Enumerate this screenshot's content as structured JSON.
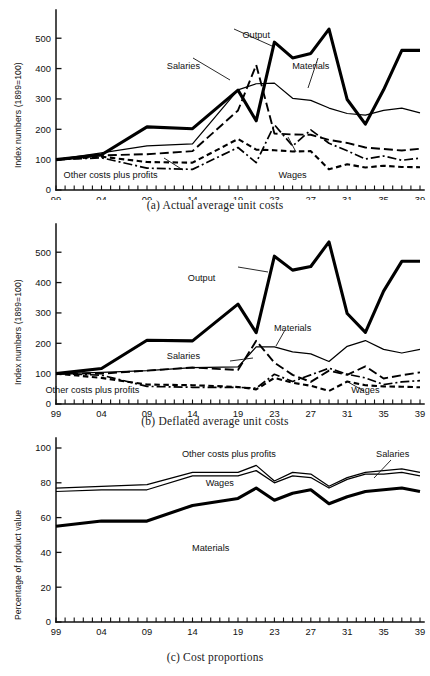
{
  "figure": {
    "panels": [
      {
        "id": "a",
        "caption": "(a)  Actual average unit costs",
        "ylabel": "Index numbers (1899=100)"
      },
      {
        "id": "b",
        "caption": "(b)  Deflated average unit costs",
        "ylabel": "Index numbers (1899=100)"
      },
      {
        "id": "c",
        "caption": "(c)  Cost proportions",
        "ylabel": "Percentage of product value"
      }
    ]
  },
  "chart_data": [
    {
      "type": "line",
      "panel": "a",
      "title": "(a)  Actual average unit costs",
      "xlabel": "",
      "ylabel": "Index numbers (1899=100)",
      "ylim": [
        0,
        560
      ],
      "yticks": [
        0,
        100,
        200,
        300,
        400,
        500
      ],
      "ytick_labels": [
        "0",
        "100",
        "200",
        "300",
        "400",
        "500"
      ],
      "xlim": [
        1899,
        1939
      ],
      "xticks": [
        1899,
        1904,
        1909,
        1914,
        1919,
        1921,
        1923,
        1925,
        1927,
        1929,
        1931,
        1933,
        1935,
        1937,
        1939
      ],
      "xtick_labels": [
        "99",
        "04",
        "09",
        "14",
        "19",
        "",
        "23",
        "",
        "27",
        "",
        "31",
        "",
        "35",
        "",
        "39"
      ],
      "grid": false,
      "legend_position": "inline-annotations",
      "x": [
        1899,
        1904,
        1909,
        1914,
        1919,
        1921,
        1923,
        1925,
        1927,
        1929,
        1931,
        1933,
        1935,
        1937,
        1939
      ],
      "series": [
        {
          "name": "Output",
          "style": "thick-solid",
          "values": [
            100,
            116,
            208,
            202,
            329,
            228,
            487,
            435,
            450,
            530,
            298,
            217,
            330,
            460,
            460
          ]
        },
        {
          "name": "Materials",
          "style": "thin-solid",
          "values": [
            100,
            122,
            145,
            152,
            330,
            350,
            352,
            302,
            295,
            270,
            252,
            247,
            262,
            270,
            254
          ]
        },
        {
          "name": "Salaries",
          "style": "long-dash",
          "values": [
            100,
            114,
            118,
            128,
            262,
            412,
            186,
            183,
            182,
            165,
            155,
            140,
            135,
            130,
            136
          ]
        },
        {
          "name": "Wages",
          "style": "short-dash",
          "values": [
            100,
            110,
            92,
            90,
            168,
            133,
            131,
            127,
            128,
            68,
            85,
            74,
            80,
            76,
            75
          ]
        },
        {
          "name": "Other costs plus profits",
          "style": "dash-dot",
          "values": [
            100,
            106,
            72,
            68,
            140,
            90,
            215,
            145,
            198,
            154,
            129,
            102,
            112,
            98,
            105
          ]
        }
      ],
      "annotations": [
        {
          "text": "Output",
          "x": 1921,
          "y": 500
        },
        {
          "text": "Salaries",
          "x": 1913,
          "y": 400
        },
        {
          "text": "Materials",
          "x": 1927,
          "y": 400
        },
        {
          "text": "Wages",
          "x": 1925,
          "y": 38
        },
        {
          "text": "Other costs plus profits",
          "x": 1905,
          "y": 38
        }
      ]
    },
    {
      "type": "line",
      "panel": "b",
      "title": "(b)  Deflated average unit costs",
      "xlabel": "",
      "ylabel": "Index numbers (1899=100)",
      "ylim": [
        0,
        560
      ],
      "yticks": [
        0,
        100,
        200,
        300,
        400,
        500
      ],
      "ytick_labels": [
        "0",
        "100",
        "200",
        "300",
        "400",
        "500"
      ],
      "xlim": [
        1899,
        1939
      ],
      "xticks": [
        1899,
        1904,
        1909,
        1914,
        1919,
        1921,
        1923,
        1925,
        1927,
        1929,
        1931,
        1933,
        1935,
        1937,
        1939
      ],
      "xtick_labels": [
        "99",
        "04",
        "09",
        "14",
        "19",
        "",
        "23",
        "",
        "27",
        "",
        "31",
        "",
        "35",
        "",
        "39"
      ],
      "grid": false,
      "legend_position": "inline-annotations",
      "x": [
        1899,
        1904,
        1909,
        1914,
        1919,
        1921,
        1923,
        1925,
        1927,
        1929,
        1931,
        1933,
        1935,
        1937,
        1939
      ],
      "series": [
        {
          "name": "Output",
          "style": "thick-solid",
          "values": [
            100,
            117,
            210,
            208,
            329,
            235,
            487,
            441,
            453,
            534,
            298,
            236,
            372,
            470,
            470
          ]
        },
        {
          "name": "Materials",
          "style": "thin-solid",
          "values": [
            100,
            104,
            110,
            120,
            122,
            188,
            188,
            172,
            165,
            140,
            190,
            209,
            180,
            168,
            180
          ]
        },
        {
          "name": "Salaries",
          "style": "long-dash",
          "values": [
            100,
            100,
            110,
            120,
            112,
            208,
            136,
            96,
            73,
            110,
            96,
            124,
            84,
            95,
            104
          ]
        },
        {
          "name": "Wages",
          "style": "short-dash",
          "values": [
            100,
            86,
            64,
            62,
            56,
            48,
            86,
            70,
            60,
            43,
            74,
            62,
            58,
            57,
            55
          ]
        },
        {
          "name": "Other costs plus profits",
          "style": "dash-dot",
          "values": [
            100,
            95,
            58,
            55,
            55,
            52,
            98,
            74,
            96,
            118,
            98,
            86,
            64,
            73,
            77
          ]
        }
      ],
      "annotations": [
        {
          "text": "Output",
          "x": 1915,
          "y": 405
        },
        {
          "text": "Materials",
          "x": 1925,
          "y": 240
        },
        {
          "text": "Salaries",
          "x": 1913,
          "y": 148
        },
        {
          "text": "Wages",
          "x": 1933,
          "y": 36
        },
        {
          "text": "Other costs plus profits",
          "x": 1903,
          "y": 36
        }
      ]
    },
    {
      "type": "line",
      "panel": "c",
      "title": "(c)  Cost proportions",
      "xlabel": "",
      "ylabel": "Percentage of product value",
      "ylim": [
        0,
        100
      ],
      "yticks": [
        0,
        20,
        40,
        60,
        80,
        100
      ],
      "ytick_labels": [
        "0",
        "20",
        "40",
        "60",
        "80",
        "100"
      ],
      "xlim": [
        1899,
        1939
      ],
      "xticks": [
        1899,
        1904,
        1909,
        1914,
        1919,
        1921,
        1923,
        1925,
        1927,
        1929,
        1931,
        1933,
        1935,
        1937,
        1939
      ],
      "xtick_labels": [
        "99",
        "04",
        "09",
        "14",
        "19",
        "",
        "23",
        "",
        "27",
        "",
        "31",
        "",
        "35",
        "",
        "39"
      ],
      "grid": false,
      "legend_position": "inline-annotations",
      "x": [
        1899,
        1904,
        1909,
        1914,
        1919,
        1921,
        1923,
        1925,
        1927,
        1929,
        1931,
        1933,
        1935,
        1937,
        1939
      ],
      "series": [
        {
          "name": "Other costs plus profits",
          "style": "thin-solid",
          "values": [
            77,
            78,
            79,
            86,
            86,
            90,
            81,
            86,
            85,
            78,
            83,
            86,
            87,
            88,
            86
          ]
        },
        {
          "name": "Salaries",
          "style": "thin-solid-partial-dash",
          "values": [
            75,
            76,
            76,
            84,
            84,
            87,
            80,
            84,
            83,
            77,
            82,
            85,
            85,
            86,
            84
          ]
        },
        {
          "name": "Materials",
          "style": "thick-solid",
          "values": [
            55,
            58,
            58,
            67,
            71,
            77,
            70,
            74,
            76,
            68,
            72,
            75,
            76,
            77,
            75
          ]
        }
      ],
      "annotations": [
        {
          "text": "Other costs plus profits",
          "x": 1918,
          "y": 95
        },
        {
          "text": "Salaries",
          "x": 1936,
          "y": 95
        },
        {
          "text": "Wages",
          "x": 1917,
          "y": 78
        },
        {
          "text": "Materials",
          "x": 1916,
          "y": 41
        }
      ]
    }
  ]
}
